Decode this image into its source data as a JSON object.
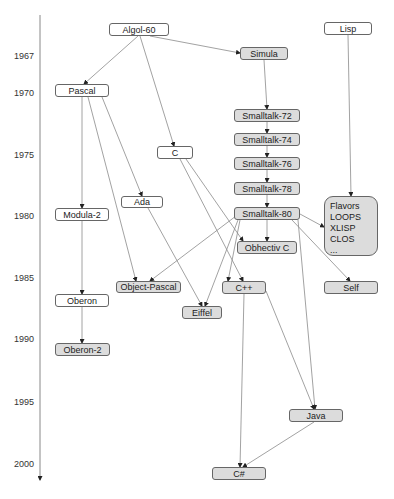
{
  "diagram": {
    "type": "timeline-graph",
    "title": "",
    "axis": {
      "direction": "down",
      "years": [
        {
          "label": "1967",
          "y": 56
        },
        {
          "label": "1970",
          "y": 93
        },
        {
          "label": "1975",
          "y": 155
        },
        {
          "label": "1980",
          "y": 216
        },
        {
          "label": "1985",
          "y": 278
        },
        {
          "label": "1990",
          "y": 339
        },
        {
          "label": "1995",
          "y": 402
        },
        {
          "label": "2000",
          "y": 464
        }
      ]
    },
    "colors": {
      "white_node": "#ffffff",
      "gray_node": "#dcdcdc",
      "border": "#666666",
      "edge": "#888888"
    },
    "nodes": {
      "algol60": {
        "label": "Algol-60",
        "style": "white"
      },
      "lisp": {
        "label": "Lisp",
        "style": "white"
      },
      "simula": {
        "label": "Simula",
        "style": "gray"
      },
      "pascal": {
        "label": "Pascal",
        "style": "white"
      },
      "smalltalk72": {
        "label": "Smalltalk-72",
        "style": "gray"
      },
      "smalltalk74": {
        "label": "Smalltalk-74",
        "style": "gray"
      },
      "smalltalk76": {
        "label": "Smalltalk-76",
        "style": "gray"
      },
      "smalltalk78": {
        "label": "Smalltalk-78",
        "style": "gray"
      },
      "smalltalk80": {
        "label": "Smalltalk-80",
        "style": "gray"
      },
      "c": {
        "label": "C",
        "style": "white"
      },
      "ada": {
        "label": "Ada",
        "style": "white"
      },
      "modula2": {
        "label": "Modula-2",
        "style": "white"
      },
      "lispfamily": {
        "lines": [
          "Flavors",
          "LOOPS",
          "XLISP",
          "CLOS",
          "..."
        ],
        "style": "gray"
      },
      "objc": {
        "label": "Obhectiv C",
        "style": "gray"
      },
      "objpascal": {
        "label": "Object-Pascal",
        "style": "gray"
      },
      "cpp": {
        "label": "C++",
        "style": "gray"
      },
      "self": {
        "label": "Self",
        "style": "gray"
      },
      "oberon": {
        "label": "Oberon",
        "style": "white"
      },
      "eiffel": {
        "label": "Eiffel",
        "style": "gray"
      },
      "oberon2": {
        "label": "Oberon-2",
        "style": "gray"
      },
      "java": {
        "label": "Java",
        "style": "gray"
      },
      "csharp": {
        "label": "C#",
        "style": "gray"
      }
    },
    "edges": [
      [
        "Algol-60",
        "Pascal"
      ],
      [
        "Algol-60",
        "Simula"
      ],
      [
        "Algol-60",
        "C"
      ],
      [
        "Simula",
        "Smalltalk-72"
      ],
      [
        "Smalltalk-72",
        "Smalltalk-74"
      ],
      [
        "Smalltalk-74",
        "Smalltalk-76"
      ],
      [
        "Smalltalk-76",
        "Smalltalk-78"
      ],
      [
        "Smalltalk-78",
        "Smalltalk-80"
      ],
      [
        "Lisp",
        "Flavors/LOOPS/XLISP/CLOS"
      ],
      [
        "Pascal",
        "Modula-2"
      ],
      [
        "Pascal",
        "Ada"
      ],
      [
        "Pascal",
        "Object-Pascal"
      ],
      [
        "Modula-2",
        "Oberon"
      ],
      [
        "Oberon",
        "Oberon-2"
      ],
      [
        "C",
        "Obhectiv C"
      ],
      [
        "C",
        "C++"
      ],
      [
        "Ada",
        "Eiffel"
      ],
      [
        "Smalltalk-80",
        "Obhectiv C"
      ],
      [
        "Smalltalk-80",
        "Object-Pascal"
      ],
      [
        "Smalltalk-80",
        "Flavors/LOOPS/XLISP/CLOS"
      ],
      [
        "Smalltalk-80",
        "Self"
      ],
      [
        "Smalltalk-80",
        "C++"
      ],
      [
        "Smalltalk-80",
        "Eiffel"
      ],
      [
        "Smalltalk-80",
        "Java"
      ],
      [
        "C++",
        "Java"
      ],
      [
        "C++",
        "C#"
      ],
      [
        "Java",
        "C#"
      ]
    ]
  }
}
